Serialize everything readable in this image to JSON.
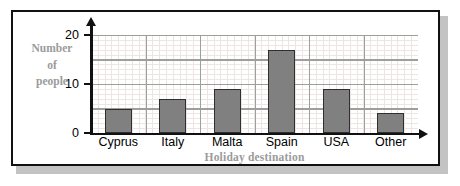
{
  "chart_data": {
    "type": "bar",
    "title": "",
    "subtitle": "",
    "categories": [
      "Cyprus",
      "Italy",
      "Malta",
      "Spain",
      "USA",
      "Other"
    ],
    "values": [
      5,
      7,
      9,
      17,
      9,
      4
    ],
    "series": [
      {
        "name": "Number of people",
        "values": [
          5,
          7,
          9,
          17,
          9,
          4
        ]
      }
    ],
    "xlabel": "Holiday destination",
    "ylabel": "Number of people",
    "ylabel_lines": [
      "Number",
      "of",
      "people"
    ],
    "ylim": [
      0,
      20
    ],
    "yticks": [
      0,
      10,
      20
    ],
    "ytick_labels": [
      "0",
      "10",
      "20"
    ],
    "y_major_gridline_step": 5,
    "grid": true,
    "minor_grid": true,
    "legend": false,
    "legend_position": "none",
    "orientation": "vertical",
    "annotations": []
  },
  "style": {
    "bar_fill": "#808080",
    "bar_edge": "#2f2f2f",
    "axis_color": "#111111",
    "major_grid_color": "#9e9e9e",
    "minor_grid_color": "#e7dcdc",
    "axis_title_color": "#9b9b9b",
    "tick_label_color": "#000000",
    "frame_border": "#111111",
    "page_background": "#ffffff",
    "shadow_color": "#b9b9b9"
  },
  "icons": {
    "y_axis_arrow": "arrow-up-icon",
    "x_axis_arrow": "arrow-right-icon"
  }
}
